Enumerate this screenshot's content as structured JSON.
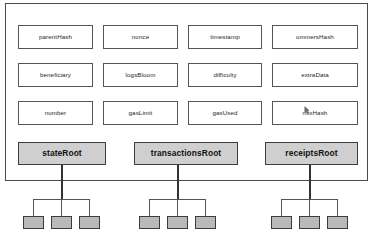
{
  "diagram": {
    "container": {
      "name": "block-header"
    },
    "header_fields": [
      {
        "id": "parentHash",
        "label": "parentHash",
        "row": 0,
        "col": 0
      },
      {
        "id": "nonce",
        "label": "nonce",
        "row": 0,
        "col": 1
      },
      {
        "id": "timestamp",
        "label": "timestamp",
        "row": 0,
        "col": 2
      },
      {
        "id": "ommersHash",
        "label": "ommersHash",
        "row": 0,
        "col": 3
      },
      {
        "id": "beneficiary",
        "label": "beneficiary",
        "row": 1,
        "col": 0
      },
      {
        "id": "logsBloom",
        "label": "logsBloom",
        "row": 1,
        "col": 1
      },
      {
        "id": "difficulty",
        "label": "difficulty",
        "row": 1,
        "col": 2
      },
      {
        "id": "extraData",
        "label": "extraData",
        "row": 1,
        "col": 3
      },
      {
        "id": "number",
        "label": "number",
        "row": 2,
        "col": 0
      },
      {
        "id": "gasLimit",
        "label": "gasLimit",
        "row": 2,
        "col": 1
      },
      {
        "id": "gasUsed",
        "label": "gasUsed",
        "row": 2,
        "col": 2
      },
      {
        "id": "mixHash",
        "label": "mixHash",
        "row": 2,
        "col": 3
      }
    ],
    "root_fields": [
      {
        "id": "stateRoot",
        "label": "stateRoot",
        "leaves": 3
      },
      {
        "id": "transactionsRoot",
        "label": "transactionsRoot",
        "leaves": 3
      },
      {
        "id": "receiptsRoot",
        "label": "receiptsRoot",
        "leaves": 3
      }
    ],
    "colors": {
      "root_fill": "#cfcfcf",
      "leaf_fill": "#b9b9b9",
      "field_fill": "#ffffff",
      "border": "#4a4a4a",
      "page_background": "#ffffff"
    },
    "layout": {
      "field_rows": 3,
      "field_cols": 4,
      "root_count": 3,
      "leaves_per_root": 3
    }
  }
}
